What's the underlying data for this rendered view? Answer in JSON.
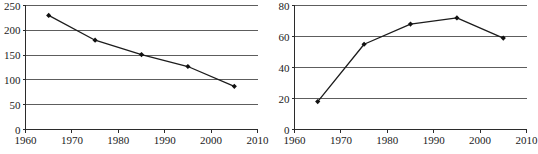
{
  "chart_data": [
    {
      "id": "left",
      "type": "line",
      "title": "",
      "xlabel": "",
      "ylabel": "",
      "xlim": [
        1960,
        2010
      ],
      "ylim": [
        0,
        250
      ],
      "grid": true,
      "legend": "none",
      "x_ticks": [
        "1960",
        "1970",
        "1980",
        "1990",
        "2000",
        "2010"
      ],
      "x_tick_values": [
        1960,
        1970,
        1980,
        1990,
        2000,
        2010
      ],
      "y_ticks": [
        "0",
        "50",
        "100",
        "150",
        "200",
        "250"
      ],
      "y_tick_values": [
        0,
        50,
        100,
        150,
        200,
        250
      ],
      "x": [
        1965,
        1975,
        1985,
        1995,
        2005
      ],
      "values": [
        230,
        180,
        151,
        127,
        87
      ],
      "marker": "diamond"
    },
    {
      "id": "right",
      "type": "line",
      "title": "",
      "xlabel": "",
      "ylabel": "",
      "xlim": [
        1960,
        2010
      ],
      "ylim": [
        0,
        80
      ],
      "grid": true,
      "legend": "none",
      "x_ticks": [
        "1960",
        "1970",
        "1980",
        "1990",
        "2000",
        "2010"
      ],
      "x_tick_values": [
        1960,
        1970,
        1980,
        1990,
        2000,
        2010
      ],
      "y_ticks": [
        "0",
        "20",
        "40",
        "60",
        "80"
      ],
      "y_tick_values": [
        0,
        20,
        40,
        60,
        80
      ],
      "x": [
        1965,
        1975,
        1985,
        1995,
        2005
      ],
      "values": [
        18,
        55,
        68,
        72,
        59
      ],
      "marker": "diamond"
    }
  ],
  "colors": {
    "gridline": "#5d5d5d",
    "axis": "#2b2b2b",
    "series": "#1c1c1c",
    "marker": "#111111",
    "background": "#ffffff",
    "text": "#1a1a1a"
  }
}
